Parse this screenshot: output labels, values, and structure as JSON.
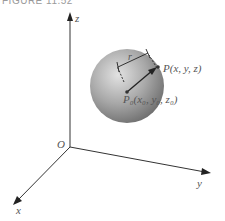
{
  "figure": {
    "caption": "FIGURE 11.52"
  },
  "axes": {
    "z_label": "z",
    "y_label": "y",
    "x_label": "x",
    "origin_label": "O"
  },
  "sphere": {
    "radius_label": "r",
    "point_label": "P(x, y, z)",
    "center_label": "P₀(x₀, y₀, z₀)",
    "fill_light": "#d8d8d8",
    "fill_dark": "#7a7a7a"
  }
}
